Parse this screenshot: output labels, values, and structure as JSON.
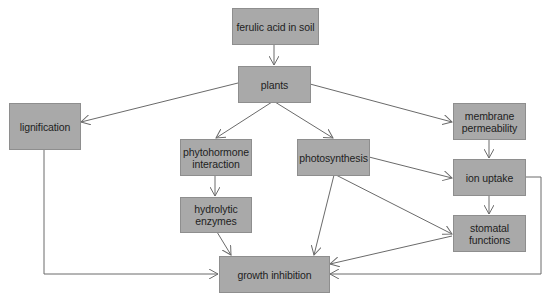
{
  "diagram": {
    "type": "flowchart",
    "nodes": {
      "ferulic_acid": {
        "label": "ferulic acid in soil"
      },
      "plants": {
        "label": "plants"
      },
      "lignification": {
        "label": "lignification"
      },
      "phytohormone": {
        "label_line1": "phytohormone",
        "label_line2": "interaction"
      },
      "photosynthesis": {
        "label": "photosynthesis"
      },
      "hydrolytic": {
        "label_line1": "hydrolytic",
        "label_line2": "enzymes"
      },
      "membrane": {
        "label_line1": "membrane",
        "label_line2": "permeability"
      },
      "ion_uptake": {
        "label": "ion uptake"
      },
      "stomatal": {
        "label_line1": "stomatal",
        "label_line2": "functions"
      },
      "growth_inhibition": {
        "label": "growth inhibition"
      }
    },
    "edges": [
      {
        "from": "ferulic acid in soil",
        "to": "plants"
      },
      {
        "from": "plants",
        "to": "lignification"
      },
      {
        "from": "plants",
        "to": "phytohormone interaction"
      },
      {
        "from": "plants",
        "to": "photosynthesis"
      },
      {
        "from": "plants",
        "to": "membrane permeability"
      },
      {
        "from": "phytohormone interaction",
        "to": "hydrolytic enzymes"
      },
      {
        "from": "hydrolytic enzymes",
        "to": "growth inhibition"
      },
      {
        "from": "photosynthesis",
        "to": "growth inhibition"
      },
      {
        "from": "photosynthesis",
        "to": "ion uptake"
      },
      {
        "from": "photosynthesis",
        "to": "stomatal functions"
      },
      {
        "from": "membrane permeability",
        "to": "ion uptake"
      },
      {
        "from": "ion uptake",
        "to": "stomatal functions"
      },
      {
        "from": "ion uptake",
        "to": "growth inhibition"
      },
      {
        "from": "stomatal functions",
        "to": "growth inhibition"
      },
      {
        "from": "lignification",
        "to": "growth inhibition"
      }
    ],
    "colors": {
      "node_fill": "#a9a9a9",
      "node_border": "#8e8e8e",
      "edge": "#6a6a6a",
      "text": "#1e1e1e"
    }
  }
}
